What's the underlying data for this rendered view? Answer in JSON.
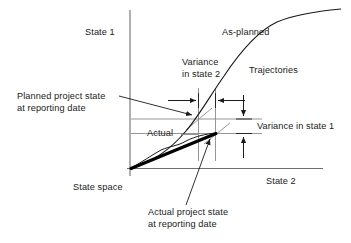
{
  "figure": {
    "type": "diagram",
    "axes": {
      "y_label": "State 1",
      "x_label": "State 2",
      "space_label": "State space"
    },
    "curves": {
      "as_planned_label": "As-planned",
      "trajectories_label": "Trajectories",
      "actual_label": "Actual"
    },
    "annotations": {
      "variance_state2_line1": "Variance",
      "variance_state2_line2": "in state 2",
      "variance_state1": "Variance in state 1",
      "planned_point_line1": "Planned project state",
      "planned_point_line2": "at reporting date",
      "actual_point_line1": "Actual project state",
      "actual_point_line2": "at reporting date"
    },
    "colors": {
      "ink": "#1a1a1a",
      "axis": "#6b6b6b",
      "gridline": "#8a8a8a",
      "curve": "#1a1a1a",
      "actual_thick": "#000000",
      "background": "#ffffff"
    }
  }
}
